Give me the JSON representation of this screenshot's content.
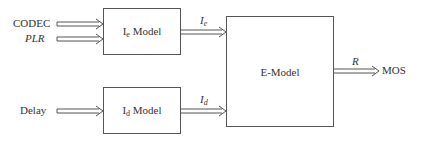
{
  "diagram": {
    "inputs": {
      "codec": "CODEC",
      "plr": "PLR",
      "delay": "Delay"
    },
    "ie_model": {
      "main": "I",
      "sub": "e",
      "suffix": " Model"
    },
    "id_model": {
      "main": "I",
      "sub": "d",
      "suffix": " Model"
    },
    "e_model": {
      "label": "E-Model"
    },
    "edges": {
      "ie_main": "I",
      "ie_sub": "e",
      "id_main": "I",
      "id_sub": "d",
      "r": "R"
    },
    "output": {
      "mos": "MOS"
    },
    "colors": {
      "line": "#555555",
      "text": "#333333",
      "background": "#ffffff"
    }
  }
}
